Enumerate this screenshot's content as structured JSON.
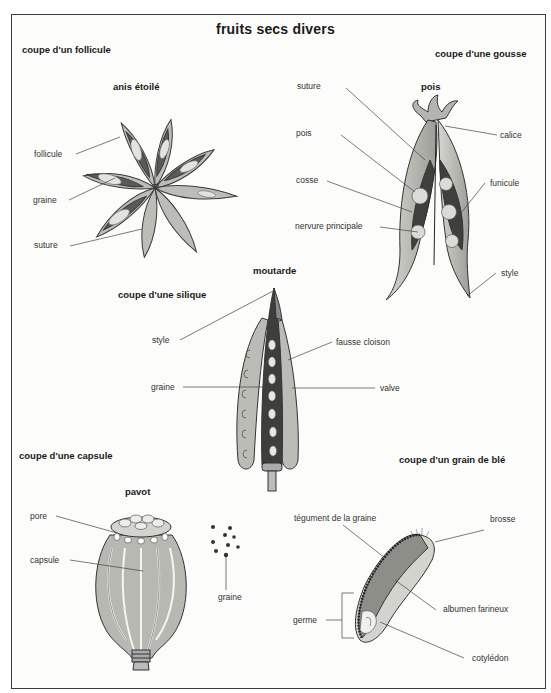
{
  "title": "fruits secs divers",
  "colors": {
    "frame": "#3a3a3a",
    "fill_light": "#c9c9c4",
    "fill_mid": "#a8a8a2",
    "fill_dark": "#4a4a48",
    "seed": "#e2e2dd",
    "line": "#555555"
  },
  "sections": {
    "follicle": {
      "heading": "coupe d'un follicule",
      "specimen": "anis étoilé",
      "labels": {
        "follicule": "follicule",
        "graine": "graine",
        "suture": "suture"
      }
    },
    "pod": {
      "heading": "coupe d'une gousse",
      "specimen": "pois",
      "labels": {
        "suture": "suture",
        "pois": "pois",
        "cosse": "cosse",
        "nervure": "nervure principale",
        "calice": "calice",
        "funicule": "funicule",
        "style": "style"
      }
    },
    "silique": {
      "heading": "coupe d'une silique",
      "specimen": "moutarde",
      "labels": {
        "style": "style",
        "fausse_cloison": "fausse cloison",
        "graine": "graine",
        "valve": "valve"
      }
    },
    "capsule": {
      "heading": "coupe d'une capsule",
      "specimen": "pavot",
      "labels": {
        "pore": "pore",
        "capsule": "capsule",
        "graine": "graine"
      }
    },
    "wheat": {
      "heading": "coupe d'un grain de blé",
      "labels": {
        "tegument": "tégument de la graine",
        "brosse": "brosse",
        "albumen": "albumen farineux",
        "germe": "germe",
        "cotyledon": "cotylédon"
      }
    }
  }
}
